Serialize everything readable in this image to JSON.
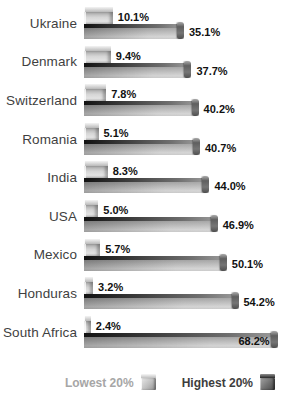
{
  "chart_data": {
    "type": "bar",
    "orientation": "horizontal",
    "title": "",
    "xlabel": "",
    "ylabel": "",
    "unit": "%",
    "xlim": [
      0,
      70
    ],
    "grid": false,
    "legend_position": "bottom-right",
    "categories": [
      "Ukraine",
      "Denmark",
      "Switzerland",
      "Romania",
      "India",
      "USA",
      "Mexico",
      "Honduras",
      "South Africa"
    ],
    "series": [
      {
        "name": "Lowest 20%",
        "values": [
          10.1,
          9.4,
          7.8,
          5.1,
          8.3,
          5.0,
          5.7,
          3.2,
          2.4
        ]
      },
      {
        "name": "Highest 20%",
        "values": [
          35.1,
          37.7,
          40.2,
          40.7,
          44.0,
          46.9,
          50.1,
          54.2,
          68.2
        ]
      }
    ],
    "value_labels": {
      "lowest": [
        "10.1%",
        "9.4%",
        "7.8%",
        "5.1%",
        "8.3%",
        "5.0%",
        "5.7%",
        "3.2%",
        "2.4%"
      ],
      "highest": [
        "35.1%",
        "37.7%",
        "40.2%",
        "40.7%",
        "44.0%",
        "46.9%",
        "50.1%",
        "54.2%",
        "68.2%"
      ]
    }
  },
  "legend": {
    "lowest_label": "Lowest 20%",
    "highest_label": "Highest 20%"
  },
  "colors": {
    "background": "#ffffff",
    "country_label": "#3f3f3f",
    "value_label": "#111111",
    "legend_lowest_text": "#a6a6a6",
    "legend_highest_text": "#3d3d3d",
    "bar_lowest_face": "#d6d6d6",
    "bar_highest_face": "#b5b5b5",
    "bar_highest_top": "#2e2e2e"
  }
}
